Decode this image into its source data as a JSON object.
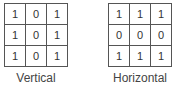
{
  "kernels": [
    {
      "label": "Vertical",
      "matrix": [
        [
          "1",
          "0",
          "1"
        ],
        [
          "1",
          "0",
          "1"
        ],
        [
          "1",
          "0",
          "1"
        ]
      ]
    },
    {
      "label": "Horizontal",
      "matrix": [
        [
          "1",
          "1",
          "1"
        ],
        [
          "0",
          "0",
          "0"
        ],
        [
          "1",
          "1",
          "1"
        ]
      ]
    }
  ]
}
